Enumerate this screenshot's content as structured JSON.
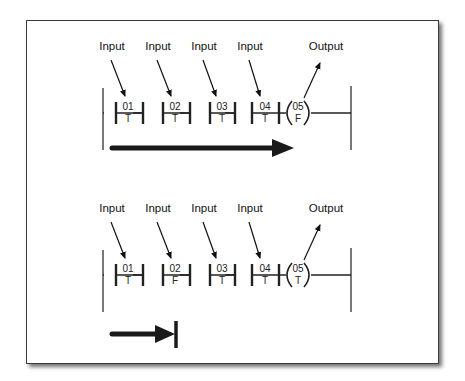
{
  "diagram": {
    "title": "",
    "rungs": [
      {
        "id": "rung-1",
        "input_label": "Input",
        "output_label": "Output",
        "contacts": [
          {
            "address": "01",
            "state": "T"
          },
          {
            "address": "02",
            "state": "T"
          },
          {
            "address": "03",
            "state": "T"
          },
          {
            "address": "04",
            "state": "T"
          }
        ],
        "coil": {
          "address": "05",
          "state": "F"
        },
        "power_flow": "complete"
      },
      {
        "id": "rung-2",
        "input_label": "Input",
        "output_label": "Output",
        "contacts": [
          {
            "address": "01",
            "state": "T"
          },
          {
            "address": "02",
            "state": "F"
          },
          {
            "address": "03",
            "state": "T"
          },
          {
            "address": "04",
            "state": "T"
          }
        ],
        "coil": {
          "address": "05",
          "state": "T"
        },
        "power_flow": "blocked"
      }
    ],
    "colors": {
      "line": "#222222",
      "rail": "#555555",
      "arrow": "#1a1a1a"
    }
  }
}
